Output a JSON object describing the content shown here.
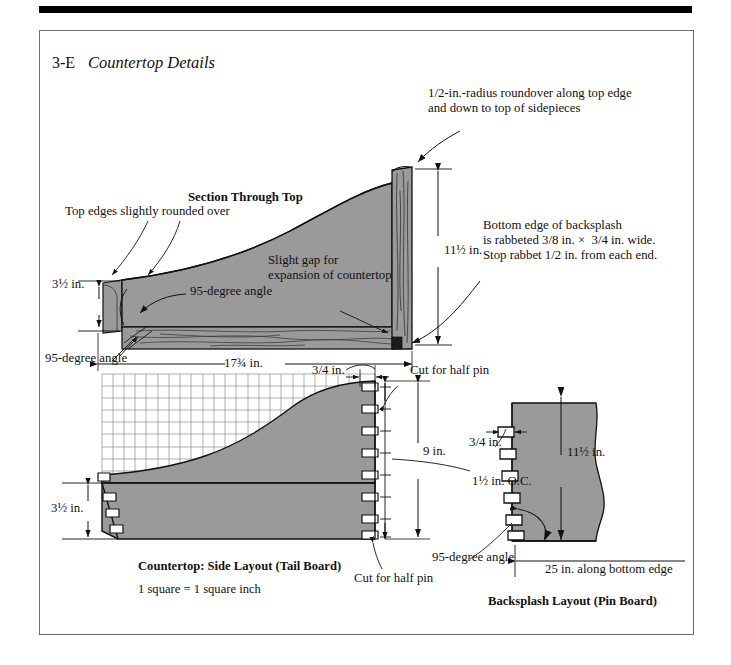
{
  "figure": {
    "number": "3-E",
    "title": "Countertop Details",
    "sheet_bar_color": "#000000",
    "fill_color": "#9a9a9a",
    "line_color": "#111111",
    "background": "#ffffff"
  },
  "section_view": {
    "heading": "Section Through Top",
    "annotations": {
      "roundover": "1/2-in.-radius roundover along top edge\nand down to top of sidepieces",
      "top_edges": "Top edges slightly rounded over",
      "angle_left": "95-degree angle",
      "gap": "Slight gap for\nexpansion of countertop",
      "rabbet": "Bottom edge of backsplash\nis rabbeted 3/8 in. ×  3/4 in. wide.\nStop rabbet 1/2 in. from each end.",
      "angle_below": "95-degree angle"
    },
    "dimensions": {
      "height_front": "3½ in.",
      "backsplash_height": "11½ in.",
      "depth": "17¾ in."
    }
  },
  "side_layout": {
    "caption": "Countertop: Side Layout (Tail Board)",
    "scale_note": "1 square = 1 square inch",
    "annotations": {
      "half_pin_top": "Cut for half pin",
      "half_pin_bottom": "Cut for half pin",
      "pin_width": "3/4 in.",
      "spacing": "1½ in. O.C."
    },
    "dimensions": {
      "tail_height": "9 in.",
      "front_height": "3½ in."
    },
    "grid": {
      "note": "1 square = 1 square inch",
      "columns": 24,
      "rows": 9
    }
  },
  "backsplash_layout": {
    "caption": "Backsplash Layout (Pin Board)",
    "annotations": {
      "pin_width": "3/4 in.",
      "angle": "95-degree angle"
    },
    "dimensions": {
      "height": "11½ in.",
      "bottom_edge": "25 in. along bottom edge"
    }
  }
}
